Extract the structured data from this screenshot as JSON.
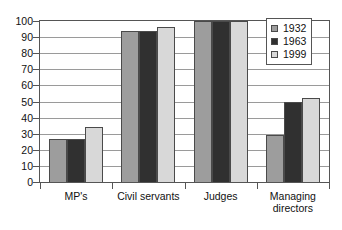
{
  "chart_data": {
    "type": "bar",
    "title": "",
    "subtitle": "",
    "xlabel": "",
    "ylabel": "",
    "categories": [
      "MP's",
      "Civil servants",
      "Judges",
      "Managing\ndirectors"
    ],
    "series": [
      {
        "name": "1932",
        "color": "#9d9d9d",
        "values": [
          27,
          94,
          100,
          29
        ]
      },
      {
        "name": "1963",
        "color": "#303030",
        "values": [
          27,
          94,
          100,
          50
        ]
      },
      {
        "name": "1999",
        "color": "#d8d8d8",
        "values": [
          34,
          96,
          100,
          52
        ]
      }
    ],
    "ylim": [
      0,
      100
    ],
    "ytick_step": 10,
    "yticks": [
      0,
      10,
      20,
      30,
      40,
      50,
      60,
      70,
      80,
      90,
      100
    ],
    "ytick_labels": [
      "0",
      "10",
      "20",
      "30",
      "40",
      "50",
      "60",
      "70",
      "80",
      "90",
      "100"
    ],
    "grid": true,
    "grid_axis": "y",
    "legend_position": "top-right",
    "legend_entries": [
      "1932",
      "1963",
      "1999"
    ]
  },
  "category_labels": [
    {
      "line1": "MP's",
      "line2": ""
    },
    {
      "line1": "Civil servants",
      "line2": ""
    },
    {
      "line1": "Judges",
      "line2": ""
    },
    {
      "line1": "Managing",
      "line2": "directors"
    }
  ]
}
